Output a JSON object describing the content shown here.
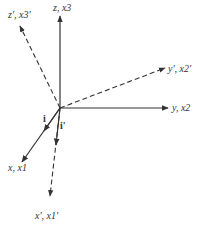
{
  "diagram": {
    "type": "coordinate-axes-rotation",
    "axes": {
      "z": {
        "label": "z, x3",
        "style": "solid"
      },
      "z_prime": {
        "label": "z', x3'",
        "style": "dashed"
      },
      "y": {
        "label": "y, x2",
        "style": "solid"
      },
      "y_prime": {
        "label": "y', x2'",
        "style": "dashed"
      },
      "x": {
        "label": "x, x1",
        "style": "solid"
      },
      "x_prime": {
        "label": "x', x1'",
        "style": "dashed"
      }
    },
    "unit_vectors": {
      "i": "i",
      "i_prime": "i'"
    },
    "colors": {
      "line": "#333333",
      "background": "#ffffff"
    }
  }
}
